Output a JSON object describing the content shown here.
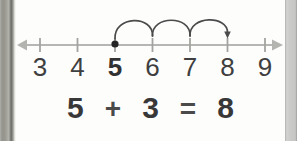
{
  "worksheet": {
    "number_line": {
      "range_start": 3,
      "range_end": 9,
      "labels": [
        "3",
        "4",
        "5",
        "6",
        "7",
        "8",
        "9"
      ],
      "start_point": "5",
      "end_point": "8",
      "hop_count": 3,
      "colors": {
        "line": "#b6b6b3",
        "tick": "#a3a3a0",
        "arc": "#4b4b4b",
        "dot": "#242424",
        "label_text": "#3f3f3f"
      }
    },
    "equation": {
      "addend1": "5",
      "plus_sign": "+",
      "addend2": "3",
      "equals_sign": "=",
      "sum": "8",
      "text_color": "#383838"
    }
  }
}
